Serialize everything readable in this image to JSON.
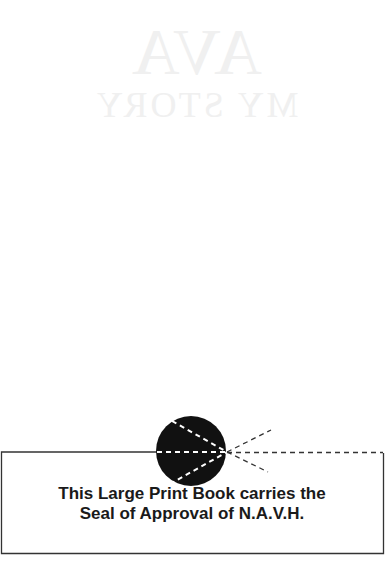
{
  "page": {
    "ghost_title": "AVA",
    "ghost_subtitle": "MY STORY"
  },
  "seal_notice": {
    "line1": "This Large Print Book carries the",
    "line2": "Seal of Approval of N.A.V.H."
  },
  "colors": {
    "background": "#ffffff",
    "ink": "#1a1a1a",
    "seal": "#111111",
    "bleed_through": "#f0f0f0"
  }
}
